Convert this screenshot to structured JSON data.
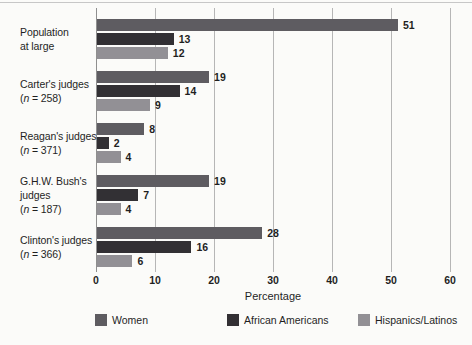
{
  "figure": {
    "background_color": "#fbfbf9",
    "top_rule_color": "#c7c7c7",
    "gridline_color": "#b6b6b6",
    "axis_line_color": "#8f8f8f",
    "text_color": "#1f1f1f"
  },
  "chart_data": {
    "type": "bar",
    "orientation": "horizontal",
    "title": "",
    "xlabel": "Percentage",
    "xlim": [
      0,
      60
    ],
    "xticks": [
      0,
      10,
      20,
      30,
      40,
      50,
      60
    ],
    "grid": true,
    "legend_position": "bottom",
    "value_labels_shown": true,
    "series": [
      {
        "name": "Women",
        "color": "#5e5c61"
      },
      {
        "name": "African Americans",
        "color": "#323034"
      },
      {
        "name": "Hispanics/Latinos",
        "color": "#929095"
      }
    ],
    "groups": [
      {
        "label_lines": [
          "Population",
          "at large"
        ],
        "n": null,
        "values": [
          51,
          13,
          12
        ]
      },
      {
        "label_lines": [
          "Carter's judges"
        ],
        "n": "258",
        "values": [
          19,
          14,
          9
        ]
      },
      {
        "label_lines": [
          "Reagan's judges"
        ],
        "n": "371",
        "values": [
          8,
          2,
          4
        ]
      },
      {
        "label_lines": [
          "G.H.W. Bush's",
          "judges"
        ],
        "n": "187",
        "values": [
          19,
          7,
          4
        ]
      },
      {
        "label_lines": [
          "Clinton's judges"
        ],
        "n": "366",
        "values": [
          28,
          16,
          6
        ]
      }
    ]
  }
}
